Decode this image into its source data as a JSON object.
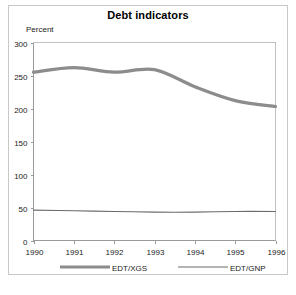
{
  "chart_data": {
    "type": "line",
    "title": "Debt indicators",
    "ylabel": "Percent",
    "xlabel": "",
    "grid": false,
    "legend_position": "bottom",
    "ylim": [
      0,
      300
    ],
    "yticks": [
      0,
      50,
      100,
      150,
      200,
      250,
      300
    ],
    "ytick_labels": [
      "0",
      "50",
      "100",
      "150",
      "200",
      "250",
      "300"
    ],
    "x": [
      1990,
      1991,
      1992,
      1993,
      1994,
      1995,
      1996
    ],
    "xtick_labels": [
      "1990",
      "1991",
      "1992",
      "1993",
      "1994",
      "1995",
      "1996"
    ],
    "series": [
      {
        "name": "EDT/XGS",
        "values": [
          255,
          262,
          255,
          259,
          233,
          212,
          203
        ],
        "color": "#8c8c8c",
        "line_width": 3.2
      },
      {
        "name": "EDT/GNP",
        "values": [
          46,
          45,
          44,
          43,
          43,
          44,
          44
        ],
        "color": "#6b6b6b",
        "line_width": 1.1
      }
    ]
  },
  "legend": {
    "items": [
      {
        "label": "EDT/XGS"
      },
      {
        "label": "EDT/GNP"
      }
    ]
  },
  "colors": {
    "frame": "#c8c8c8",
    "axis": "#9a9a9a",
    "text": "#1a1a1a",
    "series_primary": "#8c8c8c",
    "series_secondary": "#6b6b6b"
  }
}
